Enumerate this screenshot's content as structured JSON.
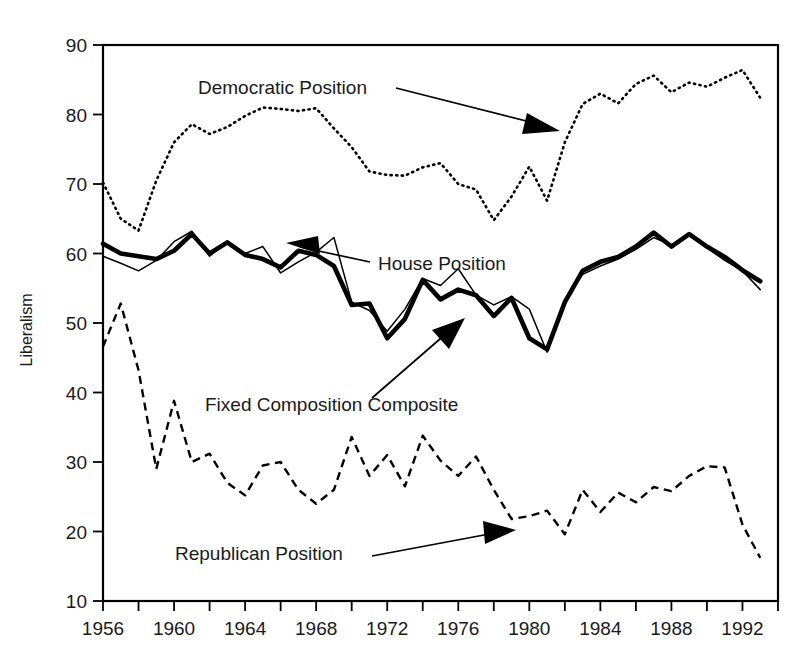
{
  "chart_data": {
    "type": "line",
    "title": "",
    "xlabel": "",
    "ylabel": "Liberalism",
    "xlim": [
      1956,
      1994
    ],
    "ylim": [
      10,
      90
    ],
    "grid": false,
    "legend_position": "inline-annotations",
    "y_ticks": [
      10,
      20,
      30,
      40,
      50,
      60,
      70,
      80,
      90
    ],
    "y_tick_labels": [
      "10",
      "20",
      "30",
      "40",
      "50",
      "60",
      "70",
      "80",
      "90"
    ],
    "x_ticks": [
      1956,
      1958,
      1960,
      1962,
      1964,
      1966,
      1968,
      1970,
      1972,
      1974,
      1976,
      1978,
      1980,
      1982,
      1984,
      1986,
      1988,
      1990,
      1992,
      1994
    ],
    "x_tick_labels": [
      "1956",
      "",
      "1960",
      "",
      "1964",
      "",
      "1968",
      "",
      "1972",
      "",
      "1976",
      "",
      "1980",
      "",
      "1984",
      "",
      "1988",
      "",
      "1992",
      ""
    ],
    "x": [
      1956,
      1957,
      1958,
      1959,
      1960,
      1961,
      1962,
      1963,
      1964,
      1965,
      1966,
      1967,
      1968,
      1969,
      1970,
      1971,
      1972,
      1973,
      1974,
      1975,
      1976,
      1977,
      1978,
      1979,
      1980,
      1981,
      1982,
      1983,
      1984,
      1985,
      1986,
      1987,
      1988,
      1989,
      1990,
      1991,
      1992,
      1993
    ],
    "series": [
      {
        "name": "Democratic Position",
        "style": "dotted",
        "values": [
          70.2,
          65.0,
          63.3,
          70.5,
          76.0,
          78.6,
          77.2,
          78.2,
          79.8,
          81.0,
          80.8,
          80.5,
          80.9,
          78.0,
          75.3,
          71.8,
          71.3,
          71.2,
          72.4,
          73.0,
          70.0,
          69.2,
          64.8,
          68.2,
          72.5,
          67.6,
          76.0,
          81.5,
          83.0,
          81.6,
          84.4,
          85.6,
          83.2,
          84.6,
          84.0,
          85.3,
          86.4,
          82.4
        ]
      },
      {
        "name": "House Position",
        "style": "thin-solid",
        "values": [
          59.6,
          58.6,
          57.5,
          59.0,
          61.7,
          63.2,
          59.6,
          61.8,
          60.0,
          61.0,
          57.2,
          58.8,
          60.2,
          62.3,
          53.0,
          51.8,
          48.8,
          52.0,
          56.4,
          55.4,
          57.8,
          54.0,
          52.6,
          53.8,
          52.0,
          45.8,
          53.2,
          57.0,
          58.2,
          59.2,
          60.6,
          62.3,
          61.2,
          62.6,
          60.8,
          59.0,
          57.5,
          54.8
        ]
      },
      {
        "name": "Fixed Composition Composite",
        "style": "thick-solid",
        "values": [
          61.4,
          60.0,
          59.6,
          59.2,
          60.4,
          62.8,
          60.0,
          61.6,
          59.8,
          59.2,
          58.0,
          60.4,
          59.8,
          58.2,
          52.6,
          52.8,
          47.8,
          50.6,
          56.2,
          53.4,
          54.8,
          54.0,
          51.0,
          53.6,
          47.8,
          46.2,
          53.0,
          57.5,
          58.8,
          59.5,
          61.0,
          63.0,
          61.0,
          62.8,
          61.0,
          59.5,
          57.6,
          56.0
        ]
      },
      {
        "name": "Republican Position",
        "style": "dashed",
        "values": [
          46.6,
          52.8,
          43.2,
          29.0,
          38.8,
          30.0,
          31.2,
          27.0,
          25.2,
          29.5,
          30.0,
          26.0,
          24.0,
          26.0,
          33.6,
          28.0,
          31.0,
          26.5,
          33.8,
          30.2,
          28.0,
          30.8,
          26.0,
          21.8,
          22.2,
          23.0,
          19.6,
          26.0,
          22.8,
          25.6,
          24.2,
          26.4,
          25.8,
          28.0,
          29.4,
          29.2,
          21.0,
          16.2
        ]
      }
    ],
    "annotations": [
      {
        "label": "Democratic Position",
        "points_to": "dotted series"
      },
      {
        "label": "House Position",
        "points_to": "thin solid series"
      },
      {
        "label": "Fixed Composition Composite",
        "points_to": "thick solid series"
      },
      {
        "label": "Republican Position",
        "points_to": "dashed series"
      }
    ]
  },
  "labels": {
    "y_axis_title": "Liberalism",
    "democratic": "Democratic Position",
    "house": "House Position",
    "composite": "Fixed Composition Composite",
    "republican": "Republican Position"
  },
  "colors": {
    "line": "#000000",
    "background": "#ffffff",
    "text": "#1a1a1a"
  }
}
